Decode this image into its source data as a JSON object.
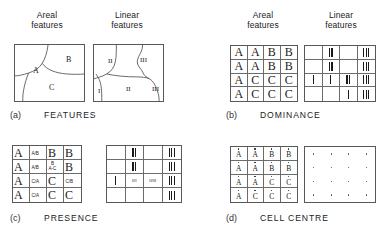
{
  "figure": {
    "column_headings": [
      {
        "line1": "Areal",
        "line2": "features"
      },
      {
        "line1": "Linear",
        "line2": "features"
      },
      {
        "line1": "Areal",
        "line2": "features"
      },
      {
        "line1": "Linear",
        "line2": "features"
      }
    ]
  },
  "panels": [
    {
      "tag": "(a)",
      "name": "FEATURES",
      "areal": {
        "type": "polygon-sketch",
        "region_labels": [
          "A",
          "B",
          "C"
        ]
      },
      "linear": {
        "type": "line-sketch",
        "line_labels": [
          "II",
          "III",
          "I",
          "II",
          "III"
        ]
      }
    },
    {
      "tag": "(b)",
      "name": "DOMINANCE",
      "areal": {
        "type": "letter-grid",
        "rows": [
          [
            "A",
            "A",
            "B",
            "B"
          ],
          [
            "A",
            "A",
            "B",
            "B"
          ],
          [
            "A",
            "C",
            "C",
            "C"
          ],
          [
            "A",
            "C",
            "C",
            "C"
          ]
        ]
      },
      "linear": {
        "type": "tick-grid",
        "rows": [
          [
            0,
            2,
            0,
            3
          ],
          [
            0,
            2,
            0,
            3
          ],
          [
            1,
            1,
            2,
            3
          ],
          [
            0,
            0,
            1,
            3
          ]
        ]
      }
    },
    {
      "tag": "(c)",
      "name": "PRESENCE",
      "areal": {
        "type": "letter-fraction-grid",
        "rows": [
          [
            {
              "big": "A",
              "small": ""
            },
            {
              "big": "",
              "small": "A/B"
            },
            {
              "big": "B",
              "small": ""
            },
            {
              "big": "B",
              "small": ""
            }
          ],
          [
            {
              "big": "A",
              "small": ""
            },
            {
              "big": "",
              "small": "A/B"
            },
            {
              "big": "",
              "small": "B\nA-C"
            },
            {
              "big": "B",
              "small": ""
            }
          ],
          [
            {
              "big": "A",
              "small": ""
            },
            {
              "big": "",
              "small": "C/A"
            },
            {
              "big": "C",
              "small": ""
            },
            {
              "big": "",
              "small": "C/B"
            }
          ],
          [
            {
              "big": "A",
              "small": ""
            },
            {
              "big": "",
              "small": "C/A"
            },
            {
              "big": "C",
              "small": ""
            },
            {
              "big": "C",
              "small": ""
            }
          ]
        ]
      },
      "linear": {
        "type": "tick-text-grid",
        "rows": [
          [
            {
              "ticks": 0,
              "text": ""
            },
            {
              "ticks": 2,
              "text": ""
            },
            {
              "ticks": 0,
              "text": ""
            },
            {
              "ticks": 3,
              "text": ""
            }
          ],
          [
            {
              "ticks": 0,
              "text": ""
            },
            {
              "ticks": 2,
              "text": ""
            },
            {
              "ticks": 0,
              "text": ""
            },
            {
              "ticks": 3,
              "text": ""
            }
          ],
          [
            {
              "ticks": 1,
              "text": ""
            },
            {
              "ticks": 0,
              "text": "I/II"
            },
            {
              "ticks": 0,
              "text": "II/III"
            },
            {
              "ticks": 3,
              "text": ""
            }
          ],
          [
            {
              "ticks": 0,
              "text": ""
            },
            {
              "ticks": 0,
              "text": ""
            },
            {
              "ticks": 0,
              "text": ""
            },
            {
              "ticks": 3,
              "text": ""
            }
          ]
        ]
      }
    },
    {
      "tag": "(d)",
      "name": "CELL CENTRE",
      "areal": {
        "type": "dotted-letter-grid",
        "rows": [
          [
            "A",
            "A",
            "B",
            "B"
          ],
          [
            "A",
            "A",
            "B",
            "B"
          ],
          [
            "A",
            "A",
            "C",
            "C"
          ],
          [
            "A",
            "C",
            "C",
            "C"
          ]
        ]
      },
      "linear": {
        "type": "dot-grid",
        "rows": [
          [
            1,
            1,
            1,
            1
          ],
          [
            1,
            1,
            1,
            1
          ],
          [
            1,
            1,
            1,
            1
          ],
          [
            1,
            1,
            1,
            1
          ]
        ]
      }
    }
  ],
  "colors": {
    "ink": "#1a1a1a",
    "rule": "#585858",
    "background": "#ffffff"
  }
}
